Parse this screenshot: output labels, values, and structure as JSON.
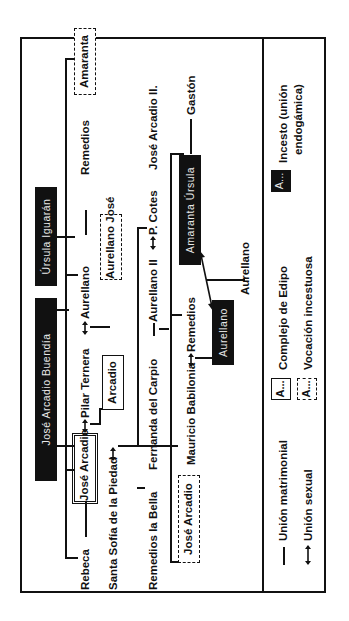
{
  "diagram": {
    "founders": {
      "father": "José Arcadio Buendía",
      "mother": "Úrsula Iguarán"
    },
    "generation_1": {
      "rebeca": "Rebeca",
      "jose_arcadio": "José Arcadio",
      "pilar_ternera": "Pilar Ternera",
      "aureliano": "Aurellano",
      "remedios": "Remedios",
      "amaranta": "Amaranta"
    },
    "generation_2": {
      "santa_sofia": "Santa Sofía de la Piedad",
      "arcadio": "Arcadio",
      "aureliano_jose": "Aurellano José"
    },
    "generation_3": {
      "remedios_la_bella": "Remedios la Bella",
      "fernanda": "Fernanda del Carpio",
      "aureliano_ii": "Aurellano II",
      "p_cotes": "P. Cotes",
      "jose_arcadio_ii": "José Arcadio II."
    },
    "generation_4": {
      "jose_arcadio": "José Arcadio",
      "mauricio": "Mauricio Babilonia",
      "remedios": "Remedios",
      "amaranta_ursula": "Amaranta Úrsula",
      "gaston": "Gastón",
      "aureliano_box": "Aurellano",
      "aureliano_child": "Aurellano"
    }
  },
  "legend": {
    "marriage": "Unión matrimonial",
    "sexual": "Unión sexual",
    "box_sample": "A...",
    "oedipus": "Complejo de Edipo",
    "incest_vocation": "Vocación incestuosa",
    "incest_box_sample": "A...",
    "incest_line1": "Incesto (unión",
    "incest_line2": "endogámica)"
  },
  "colors": {
    "ink": "#111111",
    "paper": "#ffffff",
    "black_box_text": "#e8e8e8"
  }
}
